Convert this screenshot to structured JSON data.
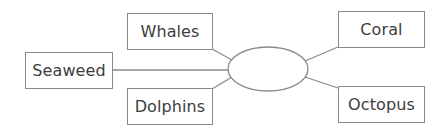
{
  "diagram": {
    "type": "spider-diagram",
    "center": {
      "label": ""
    },
    "nodes": [
      {
        "id": "whales",
        "label": "Whales"
      },
      {
        "id": "seaweed",
        "label": "Seaweed"
      },
      {
        "id": "dolphins",
        "label": "Dolphins"
      },
      {
        "id": "coral",
        "label": "Coral"
      },
      {
        "id": "octopus",
        "label": "Octopus"
      }
    ]
  },
  "colors": {
    "line": "#8a8a8a",
    "text": "#3d3d3d",
    "background": "#ffffff"
  }
}
